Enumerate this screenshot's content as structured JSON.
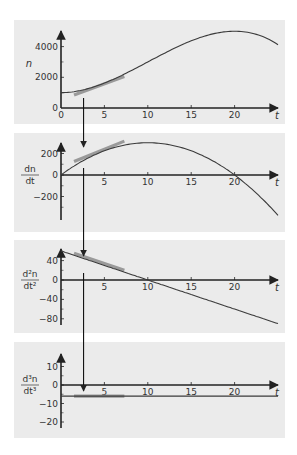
{
  "figure": {
    "panel_bg": "#ebebeb",
    "axis_color": "#222222",
    "curve_color": "#3a3a3a",
    "tangent_color": "#9a9a9a",
    "marker_t": 2.6
  },
  "chart_data": [
    {
      "type": "line",
      "title": "",
      "xlabel": "t",
      "ylabel": "n",
      "ylabel_display": "n",
      "xlim": [
        0,
        25
      ],
      "ylim": [
        0,
        5000
      ],
      "xticks": [
        0,
        5,
        10,
        15,
        20
      ],
      "yticks": [
        0,
        2000,
        4000
      ],
      "minor_yticks": [
        1000,
        3000
      ],
      "grid": false,
      "function": "n = 1000 + 30t^2 - t^3",
      "series": [
        {
          "name": "n",
          "x": [
            0,
            2.5,
            5,
            7.5,
            10,
            12.5,
            15,
            17.5,
            20,
            22.5,
            25
          ],
          "values": [
            1000,
            1172,
            1625,
            2266,
            3000,
            3734,
            4375,
            4828,
            5000,
            4797,
            4125
          ]
        }
      ],
      "tangent": {
        "t_from": 1.5,
        "t_to": 7.3,
        "y_from": 850,
        "y_to": 2050
      }
    },
    {
      "type": "line",
      "title": "",
      "xlabel": "t",
      "ylabel": "dn/dt",
      "ylabel_num": "dn",
      "ylabel_den": "dt",
      "xlim": [
        0,
        25
      ],
      "ylim": [
        -400,
        350
      ],
      "xticks": [
        5,
        10,
        15,
        20
      ],
      "yticks": [
        -200,
        0,
        200
      ],
      "minor_yticks": [
        -300,
        -100,
        100
      ],
      "grid": false,
      "function": "dn/dt = 60t - 3t^2",
      "series": [
        {
          "name": "dn/dt",
          "x": [
            0,
            2.5,
            5,
            7.5,
            10,
            12.5,
            15,
            17.5,
            20,
            22.5,
            25
          ],
          "values": [
            0,
            131,
            225,
            281,
            300,
            281,
            225,
            131,
            0,
            -169,
            -375
          ]
        }
      ],
      "tangent": {
        "t_from": 1.5,
        "t_to": 7.3,
        "y_from": 125,
        "y_to": 315
      }
    },
    {
      "type": "line",
      "title": "",
      "xlabel": "t",
      "ylabel": "d²n/dt²",
      "ylabel_num": "d²n",
      "ylabel_den": "dt²",
      "xlim": [
        0,
        25
      ],
      "ylim": [
        -95,
        65
      ],
      "xticks": [
        5,
        10,
        15,
        20
      ],
      "yticks": [
        -80,
        -40,
        0,
        40
      ],
      "minor_yticks": [
        -60,
        -20,
        20
      ],
      "grid": false,
      "function": "d²n/dt² = 60 - 6t",
      "series": [
        {
          "name": "d2n/dt2",
          "x": [
            0,
            25
          ],
          "values": [
            60,
            -90
          ]
        }
      ],
      "tangent": {
        "t_from": 1.5,
        "t_to": 7.3,
        "y_from": 55,
        "y_to": 20
      }
    },
    {
      "type": "line",
      "title": "",
      "xlabel": "t",
      "ylabel": "d³n/dt³",
      "ylabel_num": "d³n",
      "ylabel_den": "dt³",
      "xlim": [
        0,
        25
      ],
      "ylim": [
        -23,
        16
      ],
      "xticks": [
        5,
        10,
        15,
        20
      ],
      "yticks": [
        -20,
        -10,
        0,
        10
      ],
      "minor_yticks": [
        -15,
        -5,
        5
      ],
      "grid": false,
      "function": "d³n/dt³ = -6",
      "series": [
        {
          "name": "d3n/dt3",
          "x": [
            0,
            25
          ],
          "values": [
            -6,
            -6
          ]
        }
      ],
      "tangent": {
        "t_from": 1.5,
        "t_to": 7.3,
        "y_from": -6,
        "y_to": -6
      }
    }
  ],
  "layout": {
    "panels": [
      {
        "top": 20,
        "bottom": 124,
        "axis_y": 108,
        "y_top_px": 31,
        "y_scale": 0.01535,
        "y_axis_top": 31,
        "y_axis_bottom": 108
      },
      {
        "top": 133,
        "bottom": 232,
        "axis_y": 175,
        "y_scale": 0.1075,
        "y_axis_top": 143,
        "y_axis_bottom": 220
      },
      {
        "top": 240,
        "bottom": 333,
        "axis_y": 280,
        "y_scale": 0.485,
        "y_axis_top": 249,
        "y_axis_bottom": 325
      },
      {
        "top": 342,
        "bottom": 438,
        "axis_y": 385,
        "y_scale": 1.85,
        "y_axis_top": 354,
        "y_axis_bottom": 428
      }
    ],
    "left": 14,
    "right": 285,
    "origin_x": 61,
    "x_scale": 8.68,
    "axis_end_x": 278
  }
}
